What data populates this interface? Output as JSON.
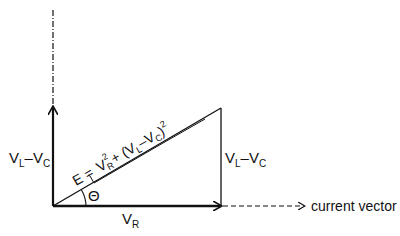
{
  "diagram": {
    "type": "phasor-diagram",
    "labels": {
      "vertical_left_main": "V",
      "vertical_left_sub1": "L",
      "vertical_left_mid": "–V",
      "vertical_left_sub2": "C",
      "vertical_right_main": "V",
      "vertical_right_sub1": "L",
      "vertical_right_mid": "–V",
      "vertical_right_sub2": "C",
      "horizontal_main": "V",
      "horizontal_sub": "R",
      "angle": "Θ",
      "current_vector": "current vector",
      "hypotenuse_eq_prefix": "E =",
      "hypotenuse_vr": "V",
      "hypotenuse_vr_sub": "R",
      "hypotenuse_sq": "2",
      "hypotenuse_plus": "+ (V",
      "hypotenuse_vl_sub": "L",
      "hypotenuse_minus": "–V",
      "hypotenuse_vc_sub": "C",
      "hypotenuse_close": ")",
      "hypotenuse_sq2": "2"
    },
    "colors": {
      "stroke": "#111111",
      "background": "#ffffff"
    }
  }
}
